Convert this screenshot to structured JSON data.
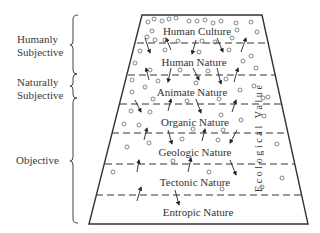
{
  "brackets": [
    {
      "label_line1": "Humanly",
      "label_line2": "Subjective"
    },
    {
      "label_line1": "Naturally",
      "label_line2": "Subjective"
    },
    {
      "label": "Objective"
    }
  ],
  "layers": [
    {
      "label": "Human Culture"
    },
    {
      "label": "Human Nature"
    },
    {
      "label": "Animate Nature"
    },
    {
      "label": "Organic Nature"
    },
    {
      "label": "Geologic Nature"
    },
    {
      "label": "Tectonic Nature"
    },
    {
      "label": "Entropic Nature"
    }
  ],
  "axis_label": "Ecological Value",
  "colors": {
    "line": "#333333",
    "text": "#333333",
    "background": "#ffffff"
  }
}
